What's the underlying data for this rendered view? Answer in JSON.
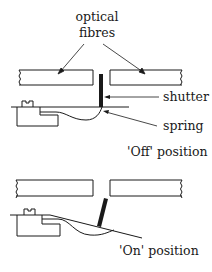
{
  "diagram": {
    "title_label": [
      "optical",
      "fibres"
    ],
    "labels": {
      "shutter": "shutter",
      "spring": "spring",
      "off_position": "'Off' position",
      "on_position": "'On' position"
    },
    "colors": {
      "line": "#1a1a1a",
      "background": "#ffffff"
    }
  }
}
